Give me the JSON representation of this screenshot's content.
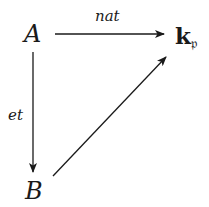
{
  "diagram": {
    "type": "commutative-triangle",
    "nodes": {
      "A": "A",
      "B": "B",
      "K": {
        "main": "k",
        "sub": "𝔭"
      }
    },
    "arrows": [
      {
        "from": "A",
        "to": "K",
        "label": "nat"
      },
      {
        "from": "A",
        "to": "B",
        "label": "et"
      },
      {
        "from": "B",
        "to": "K",
        "label": ""
      }
    ],
    "colors": {
      "ink": "#1a1a1a",
      "background": "#ffffff"
    }
  }
}
